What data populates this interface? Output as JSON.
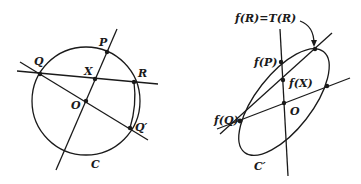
{
  "figure": {
    "left": {
      "title": "circle-construction",
      "labels": {
        "P": "P",
        "Q": "Q",
        "R": "R",
        "X": "X",
        "O": "O",
        "Q_prime": "Q′",
        "C": "C"
      }
    },
    "right": {
      "title": "ellipse-image",
      "labels": {
        "fR_TR": "f(R)=T(R)",
        "fP": "f(P)",
        "fX": "f(X)",
        "O": "O",
        "fQ": "f(Q)",
        "C_prime": "C′"
      }
    }
  }
}
